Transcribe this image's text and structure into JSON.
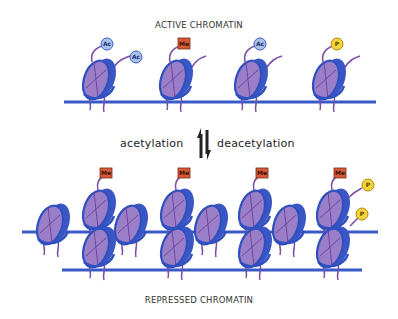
{
  "titles": {
    "top": "ACTIVE CHROMATIN",
    "bottom": "REPRESSED CHROMATIN"
  },
  "transition": {
    "left_label": "acetylation",
    "right_label": "deacetylation",
    "arrow": "equilibrium-arrows-icon"
  },
  "marks": {
    "acetyl": "Ac",
    "methyl": "Me",
    "phospho": "P"
  },
  "colors": {
    "dna": "#3a5bc7",
    "histone_fill": "#9a7fc8",
    "histone_edge": "#3050c0",
    "tail": "#7a4fa8",
    "acetyl_fill": "#a9c2e6",
    "methyl_fill": "#d65a3a",
    "phospho_fill": "#f3d23a"
  },
  "active_chromatin": {
    "nucleosomes": [
      {
        "marks": [
          "Ac",
          "Ac"
        ]
      },
      {
        "marks": [
          "Me"
        ]
      },
      {
        "marks": [
          "Ac"
        ]
      },
      {
        "marks": [
          "P"
        ]
      }
    ]
  },
  "repressed_chromatin": {
    "back_row_marks": [
      "Me",
      "Me",
      "Me",
      "Me"
    ],
    "side_marks": [
      "P",
      "P"
    ]
  }
}
